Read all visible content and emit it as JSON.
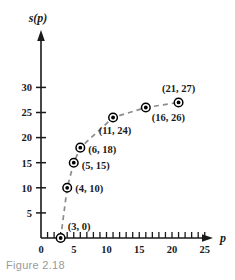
{
  "figure": {
    "caption": "Figure 2.18"
  },
  "chart_data": {
    "type": "scatter",
    "title": "",
    "xlabel": "p",
    "ylabel": "s(p)",
    "xlim": [
      0,
      26.5
    ],
    "ylim": [
      0,
      32
    ],
    "grid": false,
    "legend": null,
    "connector": "dashed",
    "x": [
      3,
      4,
      5,
      6,
      11,
      16,
      21
    ],
    "y": [
      0,
      10,
      15,
      18,
      24,
      26,
      27
    ],
    "points": [
      {
        "x": 3,
        "y": 0,
        "label": "(3, 0)"
      },
      {
        "x": 4,
        "y": 10,
        "label": "(4, 10)"
      },
      {
        "x": 5,
        "y": 15,
        "label": "(5, 15)"
      },
      {
        "x": 6,
        "y": 18,
        "label": "(6, 18)"
      },
      {
        "x": 11,
        "y": 24,
        "label": "(11, 24)"
      },
      {
        "x": 16,
        "y": 26,
        "label": "(16, 26)"
      },
      {
        "x": 21,
        "y": 27,
        "label": "(21, 27)"
      }
    ],
    "xticks": [
      0,
      1,
      2,
      3,
      4,
      5,
      6,
      7,
      8,
      9,
      10,
      11,
      12,
      13,
      14,
      15,
      16,
      17,
      18,
      19,
      20,
      21,
      22,
      23,
      24,
      25
    ],
    "xtick_labels": [
      {
        "value": 0,
        "text": "0"
      },
      {
        "value": 5,
        "text": "5"
      },
      {
        "value": 10,
        "text": "10"
      },
      {
        "value": 15,
        "text": "15"
      },
      {
        "value": 20,
        "text": "20"
      },
      {
        "value": 25,
        "text": "25"
      }
    ],
    "yticks": [
      5,
      10,
      15,
      20,
      25,
      30
    ],
    "ytick_labels": [
      {
        "value": 5,
        "text": "5"
      },
      {
        "value": 10,
        "text": "10"
      },
      {
        "value": 15,
        "text": "15"
      },
      {
        "value": 20,
        "text": "20"
      },
      {
        "value": 25,
        "text": "25"
      },
      {
        "value": 30,
        "text": "30"
      }
    ],
    "colors": {
      "axis": "#1a1a1a",
      "marker_fill": "#000000",
      "marker_ring": "#000000",
      "connector": "#8c8c8c",
      "text": "#1a1a1a",
      "caption": "#9a9a9a"
    }
  }
}
